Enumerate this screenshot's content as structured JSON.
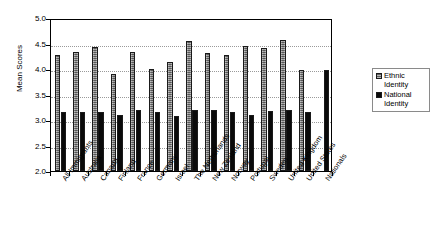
{
  "chart_data": {
    "type": "bar",
    "title": "",
    "xlabel": "",
    "ylabel": "Mean Scores",
    "ylim": [
      2.0,
      5.0
    ],
    "ytick_step": 0.5,
    "yticks": [
      "5.0",
      "4.5",
      "4.0",
      "3.5",
      "3.0",
      "2.5",
      "2.0"
    ],
    "grid": true,
    "legend_position": "right",
    "categories": [
      "All Immigrants",
      "Australia",
      "Canada",
      "Finland",
      "France",
      "Germany",
      "Israel",
      "The Netherlands",
      "New Zealand",
      "Norway",
      "Portugal",
      "Sweden",
      "United Kingdom",
      "United States",
      "Nationals"
    ],
    "series": [
      {
        "name": "Ethnic Identity",
        "color": "#7d7d7d",
        "values": [
          4.27,
          4.34,
          4.44,
          3.9,
          4.34,
          4.01,
          4.13,
          4.54,
          4.32,
          4.28,
          4.45,
          4.41,
          4.57,
          3.98,
          null
        ]
      },
      {
        "name": "National Identity",
        "color": "#0a0a0a",
        "values": [
          3.16,
          3.16,
          3.15,
          3.09,
          3.19,
          3.15,
          3.08,
          3.19,
          3.2,
          3.16,
          3.1,
          3.17,
          3.19,
          3.16,
          3.98
        ]
      }
    ]
  },
  "legend": {
    "items": [
      {
        "label_line1": "Ethnic",
        "label_line2": "Identity",
        "swatch": "ethnic-swatch"
      },
      {
        "label_line1": "National",
        "label_line2": "Identity",
        "swatch": "national-swatch"
      }
    ]
  }
}
